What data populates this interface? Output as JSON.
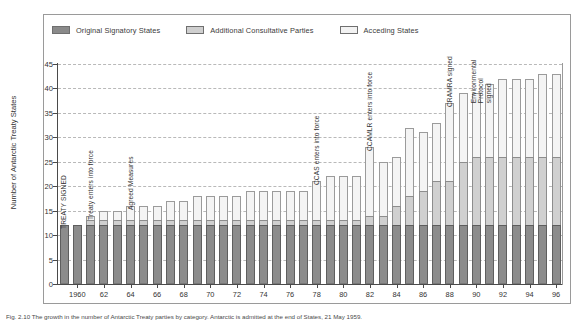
{
  "figure": {
    "caption": "Fig. 2.10 The growth in the number of Antarctic Treaty parties by category. Antarctic is admitted at the end of States, 21 May 1959."
  },
  "legend": {
    "position": "top",
    "items": [
      {
        "label": "Original Signatory States",
        "color": "#8c8c8c",
        "key": "original"
      },
      {
        "label": "Additional Consultative Parties",
        "color": "#d0d0d0",
        "key": "additional"
      },
      {
        "label": "Acceding States",
        "color": "#f4f4f4",
        "key": "acceding"
      }
    ]
  },
  "axes": {
    "ylabel": "Number of Antarctic Treaty States",
    "xlabel": "",
    "ylim": [
      0,
      45
    ],
    "yticks": [
      0,
      5,
      10,
      15,
      20,
      25,
      30,
      35,
      40,
      45
    ],
    "xticks": [
      "1960",
      "62",
      "64",
      "66",
      "68",
      "70",
      "72",
      "74",
      "76",
      "78",
      "80",
      "82",
      "84",
      "86",
      "88",
      "90",
      "92",
      "94",
      "96"
    ],
    "grid": true
  },
  "annotations": [
    {
      "text": "TREATY SIGNED",
      "year": 1959
    },
    {
      "text": "Treaty enters into force",
      "year": 1961
    },
    {
      "text": "Agreed Measures",
      "year": 1964
    },
    {
      "text": "CCAS enters into force",
      "year": 1978
    },
    {
      "text": "CCAMLR enters into force",
      "year": 1982
    },
    {
      "text": "CRAMRA signed",
      "year": 1988
    },
    {
      "text": "Environmental Protocol signed",
      "year": 1991
    }
  ],
  "chart_data": {
    "type": "bar",
    "stacked": true,
    "title": "",
    "xlabel": "",
    "ylabel": "Number of Antarctic Treaty States",
    "ylim": [
      0,
      45
    ],
    "categories": [
      "1959",
      "1960",
      "1961",
      "1962",
      "1963",
      "1964",
      "1965",
      "1966",
      "1967",
      "1968",
      "1969",
      "1970",
      "1971",
      "1972",
      "1973",
      "1974",
      "1975",
      "1976",
      "1977",
      "1978",
      "1979",
      "1980",
      "1981",
      "1982",
      "1983",
      "1984",
      "1985",
      "1986",
      "1987",
      "1988",
      "1989",
      "1990",
      "1991",
      "1992",
      "1993",
      "1994",
      "1995",
      "1996"
    ],
    "series": [
      {
        "name": "Original Signatory States",
        "values": [
          12,
          12,
          12,
          12,
          12,
          12,
          12,
          12,
          12,
          12,
          12,
          12,
          12,
          12,
          12,
          12,
          12,
          12,
          12,
          12,
          12,
          12,
          12,
          12,
          12,
          12,
          12,
          12,
          12,
          12,
          12,
          12,
          12,
          12,
          12,
          12,
          12,
          12
        ]
      },
      {
        "name": "Additional Consultative Parties",
        "values": [
          0,
          0,
          1,
          1,
          1,
          1,
          1,
          1,
          1,
          1,
          1,
          1,
          1,
          1,
          1,
          1,
          1,
          1,
          1,
          1,
          1,
          1,
          1,
          2,
          2,
          4,
          6,
          7,
          9,
          9,
          13,
          14,
          14,
          14,
          14,
          14,
          14,
          14
        ]
      },
      {
        "name": "Acceding States",
        "values": [
          0,
          0,
          1,
          2,
          2,
          3,
          3,
          3,
          4,
          4,
          5,
          5,
          5,
          5,
          6,
          6,
          6,
          6,
          6,
          8,
          9,
          9,
          9,
          14,
          11,
          10,
          14,
          12,
          12,
          16,
          14,
          13,
          15,
          16,
          16,
          16,
          17,
          17
        ]
      }
    ],
    "totals": [
      12,
      12,
      14,
      15,
      15,
      16,
      16,
      16,
      17,
      17,
      18,
      18,
      18,
      18,
      19,
      19,
      19,
      19,
      19,
      21,
      22,
      22,
      22,
      28,
      25,
      26,
      32,
      31,
      33,
      37,
      39,
      39,
      41,
      42,
      42,
      42,
      43,
      43
    ]
  }
}
